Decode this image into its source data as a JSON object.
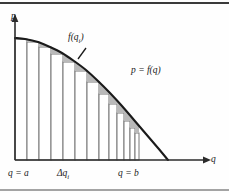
{
  "figure": {
    "name": "riemann-sum-demand-curve",
    "background_color": "#fefefe",
    "border_color": "#3a3a3a",
    "curve_color": "#1a1a1a",
    "axis_color": "#2b2b2b",
    "bar_stroke_color": "#777777",
    "bar_fill_color": "#ffffff",
    "shade_fill_color": "#b9b9b9"
  },
  "axes": {
    "y_label": "p",
    "x_label": "q",
    "origin": {
      "x": 15,
      "y": 160
    },
    "x_axis_end": {
      "x": 205,
      "y": 160
    },
    "y_axis_top": {
      "x": 15,
      "y": 20
    }
  },
  "annotations": {
    "curve_label": "p = f(q)",
    "height_label": "f(q",
    "height_label_sub": "i",
    "height_label_tail": ")",
    "left_bound": "q = a",
    "right_bound": "q = b",
    "width_label": "Δq",
    "width_label_sub": "i",
    "leader_line_from": {
      "x": 86,
      "y": 48
    },
    "leader_line_to": {
      "x": 78,
      "y": 59
    }
  },
  "chart_data": {
    "type": "area",
    "title": "",
    "xlabel": "q",
    "ylabel": "p",
    "curve_equation": "p = f(q)",
    "curve_points": [
      [
        15,
        38
      ],
      [
        25,
        39
      ],
      [
        38,
        42
      ],
      [
        50,
        47
      ],
      [
        62,
        53
      ],
      [
        74,
        61
      ],
      [
        86,
        70
      ],
      [
        98,
        81
      ],
      [
        110,
        93
      ],
      [
        122,
        106
      ],
      [
        134,
        120
      ],
      [
        146,
        134
      ],
      [
        158,
        148
      ],
      [
        168,
        160
      ]
    ],
    "bars": [
      {
        "index": 1,
        "x_left": 15,
        "x_right": 27,
        "top": 39,
        "delta_q": 12
      },
      {
        "index": 2,
        "x_left": 27,
        "x_right": 39,
        "top": 42,
        "delta_q": 12
      },
      {
        "index": 3,
        "x_left": 39,
        "x_right": 51,
        "top": 47,
        "delta_q": 12
      },
      {
        "index": 4,
        "x_left": 51,
        "x_right": 63,
        "top": 54,
        "delta_q": 12
      },
      {
        "index": 5,
        "x_left": 63,
        "x_right": 75,
        "top": 62,
        "delta_q": 12
      },
      {
        "index": 6,
        "x_left": 75,
        "x_right": 87,
        "top": 71,
        "delta_q": 12
      },
      {
        "index": 7,
        "x_left": 87,
        "x_right": 99,
        "top": 82,
        "delta_q": 12
      },
      {
        "index": 8,
        "x_left": 99,
        "x_right": 109,
        "top": 94,
        "delta_q": 10
      },
      {
        "index": 9,
        "x_left": 109,
        "x_right": 117,
        "top": 104,
        "delta_q": 8
      },
      {
        "index": 10,
        "x_left": 117,
        "x_right": 124,
        "top": 113,
        "delta_q": 7
      },
      {
        "index": 11,
        "x_left": 124,
        "x_right": 130,
        "top": 121,
        "delta_q": 6
      },
      {
        "index": 12,
        "x_left": 130,
        "x_right": 135,
        "top": 128,
        "delta_q": 5
      },
      {
        "index": 13,
        "x_left": 135,
        "x_right": 139,
        "top": 133,
        "delta_q": 4
      }
    ],
    "bound_a": 15,
    "bound_b": 139,
    "axis_ranges": {
      "x": [
        15,
        205
      ],
      "y": [
        20,
        160
      ]
    },
    "grid": false,
    "legend": "none"
  }
}
